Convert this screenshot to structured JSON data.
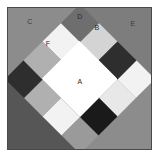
{
  "figure": {
    "name": "quilt-block-diagram",
    "width": 159,
    "height": 157,
    "background": "#ffffff",
    "frame_color": "#4a4a4a"
  },
  "palette": {
    "white": "#ffffff",
    "near_white": "#f2f2f2",
    "light_gray": "#d4d4d4",
    "medium_light_gray": "#b0b0b0",
    "medium_gray": "#8c8c8c",
    "medium_dark_gray": "#6e6e6e",
    "dark_gray": "#4a4a4a",
    "very_dark_gray": "#2e2e2e",
    "black": "#1a1a1a"
  },
  "corners": [
    {
      "name": "top-left-corner",
      "label": "C",
      "color": "#8c8c8c"
    },
    {
      "name": "top-right-corner",
      "label": "E",
      "color": "#7d7d7d"
    },
    {
      "name": "bottom-left-corner",
      "label": "",
      "color": "#565656"
    },
    {
      "name": "bottom-right-corner",
      "label": "",
      "color": "#8c8c8c"
    }
  ],
  "patches": [
    {
      "id": "r0c0",
      "color": "#6e6e6e",
      "label": ""
    },
    {
      "id": "r0c1",
      "color": "#d4d4d4",
      "label": "F"
    },
    {
      "id": "r0c2",
      "color": "#2e2e2e",
      "label": ""
    },
    {
      "id": "r0c3",
      "color": "#f2f2f2",
      "label": "D"
    },
    {
      "id": "r1c0",
      "color": "#f2f2f2",
      "label": ""
    },
    {
      "id": "r1c1",
      "color": "#ffffff",
      "label": ""
    },
    {
      "id": "r1c2",
      "color": "#ffffff",
      "label": ""
    },
    {
      "id": "r1c3",
      "color": "#e8e8e8",
      "label": "B"
    },
    {
      "id": "r2c0",
      "color": "#b0b0b0",
      "label": ""
    },
    {
      "id": "r2c1",
      "color": "#ffffff",
      "label": "A"
    },
    {
      "id": "r2c2",
      "color": "#ffffff",
      "label": ""
    },
    {
      "id": "r2c3",
      "color": "#1a1a1a",
      "label": ""
    },
    {
      "id": "r3c0",
      "color": "#2e2e2e",
      "label": ""
    },
    {
      "id": "r3c1",
      "color": "#b0b0b0",
      "label": ""
    },
    {
      "id": "r3c2",
      "color": "#f2f2f2",
      "label": ""
    },
    {
      "id": "r3c3",
      "color": "#9a9a9a",
      "label": ""
    }
  ],
  "ring": [
    {
      "name": "ring-patch-top",
      "color": "#f2f2f2",
      "label": "D"
    },
    {
      "name": "ring-patch-top-right-a",
      "color": "#e8e8e8",
      "label": "B"
    },
    {
      "name": "ring-patch-top-right-b",
      "color": "#1a1a1a",
      "label": ""
    },
    {
      "name": "ring-patch-right",
      "color": "#9a9a9a",
      "label": ""
    },
    {
      "name": "ring-patch-right-low",
      "color": "#e0e0e0",
      "label": ""
    },
    {
      "name": "ring-patch-bottom-right",
      "color": "#6e6e6e",
      "label": ""
    },
    {
      "name": "ring-patch-bottom",
      "color": "#f2f2f2",
      "label": ""
    },
    {
      "name": "ring-patch-bottom-left",
      "color": "#b0b0b0",
      "label": ""
    },
    {
      "name": "ring-patch-left-low",
      "color": "#2e2e2e",
      "label": ""
    },
    {
      "name": "ring-patch-left",
      "color": "#b0b0b0",
      "label": ""
    },
    {
      "name": "ring-patch-left-high",
      "color": "#f2f2f2",
      "label": ""
    },
    {
      "name": "ring-patch-top-left-b",
      "color": "#6e6e6e",
      "label": ""
    },
    {
      "name": "ring-patch-top-left-a",
      "color": "#d4d4d4",
      "label": "F"
    },
    {
      "name": "ring-patch-top-left-c",
      "color": "#2e2e2e",
      "label": ""
    }
  ],
  "center": {
    "name": "center-patch",
    "label": "A",
    "color": "#ffffff"
  },
  "labels": [
    {
      "key": "A",
      "text": "A",
      "x": 79,
      "y": 80,
      "tone": "dark"
    },
    {
      "key": "B",
      "text": "B",
      "x": 96,
      "y": 26,
      "tone": "dark"
    },
    {
      "key": "C",
      "text": "C",
      "x": 29,
      "y": 20,
      "tone": "light"
    },
    {
      "key": "D",
      "text": "D",
      "x": 79,
      "y": 15,
      "tone": "dark"
    },
    {
      "key": "E",
      "text": "E",
      "x": 132,
      "y": 22,
      "tone": "light"
    },
    {
      "key": "F",
      "text": "F",
      "x": 47,
      "y": 42,
      "tone": "dark"
    }
  ]
}
